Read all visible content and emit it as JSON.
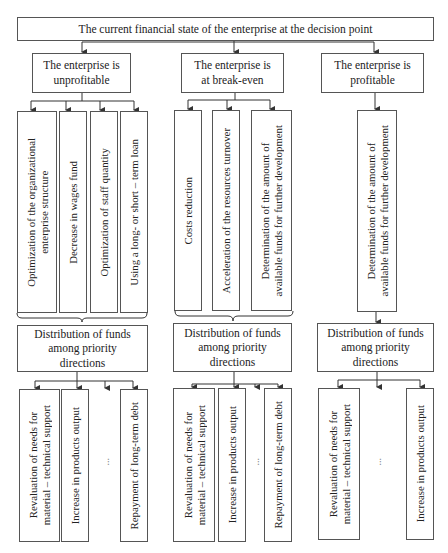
{
  "diagram": {
    "root": {
      "label": "The current financial state of the enterprise at the decision point"
    },
    "branches": [
      {
        "id": "unprofitable",
        "state": "The enterprise is\nunprofitable",
        "measures": [
          "Optimization of the organizational\nenterprise structure",
          "Decrease in wages fund",
          "Optimization of staff quantity",
          "Using a long- or short – term loan"
        ],
        "distribution": "Distribution of funds\namong priority\ndirections",
        "directions": [
          "Revaluation of needs for\nmaterial – technical support",
          "Increase in products output",
          "...",
          "Repayment of long-term debt"
        ]
      },
      {
        "id": "break-even",
        "state": "The enterprise is\nat break-even",
        "measures": [
          "Costs reduction",
          "Acceleration of the resources turnover",
          "Determination of the amount of\navailable funds for further development"
        ],
        "distribution": "Distribution of funds\namong priority\ndirections",
        "directions": [
          "Revaluation of needs for\nmaterial – technical support",
          "Increase in products output",
          "...",
          "Repayment of long-term debt"
        ]
      },
      {
        "id": "profitable",
        "state": "The enterprise is\nprofitable",
        "measures": [
          "Determination of the amount of\navailable funds for further development"
        ],
        "distribution": "Distribution of funds\namong priority\ndirections",
        "directions": [
          "Revaluation of needs for\nmaterial – technical support",
          "...",
          "Increase in products output"
        ]
      }
    ],
    "colors": {
      "line": "#333333",
      "border": "#555555",
      "text": "#222222",
      "background": "#ffffff"
    }
  }
}
